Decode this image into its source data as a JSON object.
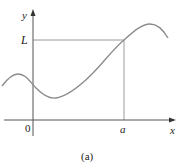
{
  "figure": {
    "caption": "(a)",
    "axes": {
      "x_label": "x",
      "y_label": "y",
      "origin_label": "0"
    },
    "annotations": {
      "horizontal_level_label": "L",
      "vertical_point_label": "a"
    },
    "colors": {
      "curve": "#8a8a8a",
      "axes": "#555555",
      "guides": "#9a9a9a",
      "text": "#222222"
    }
  }
}
